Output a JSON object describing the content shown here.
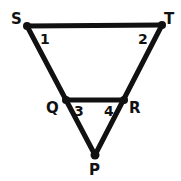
{
  "diagram": {
    "type": "geometry",
    "stroke_color": "#111111",
    "background": "#ffffff",
    "vertices": [
      {
        "name": "S",
        "x": 27,
        "y": 26
      },
      {
        "name": "T",
        "x": 162,
        "y": 25
      },
      {
        "name": "Q",
        "x": 66,
        "y": 100
      },
      {
        "name": "R",
        "x": 124,
        "y": 100
      },
      {
        "name": "P",
        "x": 95,
        "y": 155
      }
    ],
    "segments": [
      [
        "S",
        "T"
      ],
      [
        "S",
        "P"
      ],
      [
        "T",
        "P"
      ],
      [
        "Q",
        "R"
      ]
    ],
    "vertex_labels": {
      "S": "S",
      "T": "T",
      "Q": "Q",
      "R": "R",
      "P": "P"
    },
    "angle_labels": {
      "a1": "1",
      "a2": "2",
      "a3": "3",
      "a4": "4"
    }
  }
}
